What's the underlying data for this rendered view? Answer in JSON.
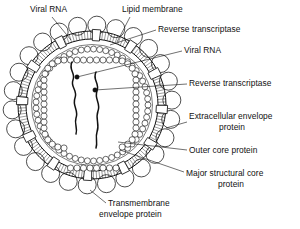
{
  "figure": {
    "kind": "biological-schematic",
    "line_color": "#111111",
    "background_color": "#ffffff"
  },
  "labels": [
    {
      "id": "viral-rna-top",
      "text": "Viral RNA",
      "x": 30,
      "y": 12,
      "align": "start"
    },
    {
      "id": "lipid-membrane",
      "text": "Lipid membrane",
      "x": 122,
      "y": 12,
      "align": "start"
    },
    {
      "id": "reverse-transcriptase-top",
      "text": "Reverse transcriptase",
      "x": 158,
      "y": 32,
      "align": "start"
    },
    {
      "id": "viral-rna-right",
      "text": "Viral RNA",
      "x": 184,
      "y": 53,
      "align": "start"
    },
    {
      "id": "reverse-transcriptase-right",
      "text": "Reverse transcriptase",
      "x": 189,
      "y": 86,
      "align": "start"
    },
    {
      "id": "extracellular-envelope-protein-l1",
      "text": "Extracellular envelope",
      "x": 189,
      "y": 119,
      "align": "start"
    },
    {
      "id": "extracellular-envelope-protein-l2",
      "text": "protein",
      "x": 232,
      "y": 130,
      "align": "middle"
    },
    {
      "id": "outer-core-protein",
      "text": "Outer core protein",
      "x": 189,
      "y": 153,
      "align": "start"
    },
    {
      "id": "major-structural-core-protein-l1",
      "text": "Major structural core",
      "x": 186,
      "y": 176,
      "align": "start"
    },
    {
      "id": "major-structural-core-protein-l2",
      "text": "protein",
      "x": 231,
      "y": 187,
      "align": "middle"
    },
    {
      "id": "transmembrane-envelope-protein-l1",
      "text": "Transmembrane",
      "x": 108,
      "y": 206,
      "align": "start"
    },
    {
      "id": "transmembrane-envelope-protein-l2",
      "text": "envelope protein",
      "x": 99,
      "y": 217,
      "align": "start"
    }
  ],
  "structures": {
    "virus": {
      "center_x": 92,
      "center_y": 105,
      "membrane_outer_radius": 74,
      "membrane_inner_radius": 66
    },
    "extracellular_envelope_protein": {
      "count": 26,
      "ring_radius": 80,
      "knob_radius": 9
    },
    "transmembrane_envelope_protein": {
      "count": 12,
      "name": "membrane-spanning segment"
    },
    "outer_core_protein": {
      "name": "beaded ring",
      "ring_radius": 56,
      "bead_radius": 3
    },
    "major_structural_core_protein": {
      "name": "beaded cylindrical capsid",
      "bead_radius": 3.1
    },
    "viral_rna": {
      "strands": 2
    },
    "reverse_transcriptase": {
      "count": 2
    }
  },
  "leaders": [
    {
      "id": "leader-viral-rna-top",
      "from_x": 52,
      "from_y": 17,
      "to_x": 71,
      "to_y": 40
    },
    {
      "id": "leader-lipid-membrane",
      "from_x": 130,
      "from_y": 17,
      "to_x": 117,
      "to_y": 42
    },
    {
      "id": "leader-reverse-transcriptase-top",
      "from_x": 156,
      "from_y": 30,
      "to_x": 110,
      "to_y": 45
    },
    {
      "id": "leader-viral-rna-right",
      "from_x": 182,
      "from_y": 51,
      "to_x": 77,
      "to_y": 77
    },
    {
      "id": "leader-reverse-transcriptase-right",
      "from_x": 187,
      "from_y": 84,
      "to_x": 95,
      "to_y": 90
    },
    {
      "id": "leader-extracellular-envelope-protein",
      "from_x": 187,
      "from_y": 122,
      "to_x": 166,
      "to_y": 128
    },
    {
      "id": "leader-outer-core-protein",
      "from_x": 187,
      "from_y": 150,
      "to_x": 118,
      "to_y": 142
    },
    {
      "id": "leader-major-structural-core-protein",
      "from_x": 184,
      "from_y": 172,
      "to_x": 120,
      "to_y": 150
    },
    {
      "id": "leader-transmembrane-envelope-protein",
      "from_x": 106,
      "from_y": 203,
      "to_x": 90,
      "to_y": 190
    }
  ]
}
